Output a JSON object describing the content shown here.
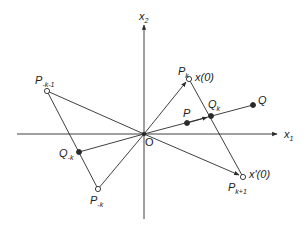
{
  "figure": {
    "axes": {
      "x1_label": "x",
      "x1_sub": "1",
      "x2_label": "x",
      "x2_sub": "2",
      "origin_label": "O"
    },
    "points": {
      "P_k": {
        "label": "P",
        "sub": "k",
        "x": 189,
        "y": 79,
        "style": "hollow"
      },
      "P_k1": {
        "label": "P",
        "sub": "k+1",
        "x": 243,
        "y": 177,
        "style": "hollow"
      },
      "P_mk1": {
        "label": "P",
        "sub": "-k-1",
        "x": 47,
        "y": 91,
        "style": "hollow"
      },
      "P_mk": {
        "label": "P",
        "sub": "-k",
        "x": 98,
        "y": 189,
        "style": "hollow"
      },
      "Q_k": {
        "label": "Q",
        "sub": "k",
        "x": 211,
        "y": 116,
        "style": "filled"
      },
      "Q": {
        "label": "Q",
        "sub": "",
        "x": 253,
        "y": 105,
        "style": "filled"
      },
      "P": {
        "label": "P",
        "sub": "",
        "x": 187,
        "y": 123,
        "style": "filled"
      },
      "Q_mk": {
        "label": "Q",
        "sub": "-k",
        "x": 79,
        "y": 152,
        "style": "filled"
      }
    },
    "vector_labels": {
      "x0": "x(0)",
      "xprime0": "x'(0)"
    },
    "colors": {
      "line": "#2a2a2a",
      "background": "#ffffff"
    }
  }
}
